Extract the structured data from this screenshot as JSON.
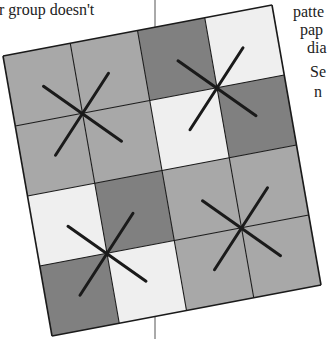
{
  "text": {
    "left_top": "r group doesn't",
    "right_lines": [
      "patte",
      "pap",
      "dia",
      "Se",
      "n"
    ]
  },
  "figure": {
    "grid": {
      "rows": 4,
      "cols": 4,
      "cells": [
        [
          "medium",
          "medium",
          "dark",
          "light"
        ],
        [
          "medium",
          "medium",
          "light",
          "dark"
        ],
        [
          "light",
          "dark",
          "medium",
          "medium"
        ],
        [
          "dark",
          "light",
          "medium",
          "medium"
        ]
      ]
    },
    "colors": {
      "dark": "#808080",
      "medium": "#a8a8a8",
      "light": "#efefef",
      "line": "#1a1a1a",
      "divider": "#555555"
    },
    "marks": [
      {
        "col": 1,
        "row": 1
      },
      {
        "col": 3,
        "row": 1
      },
      {
        "col": 1,
        "row": 3
      },
      {
        "col": 3,
        "row": 3
      }
    ]
  }
}
